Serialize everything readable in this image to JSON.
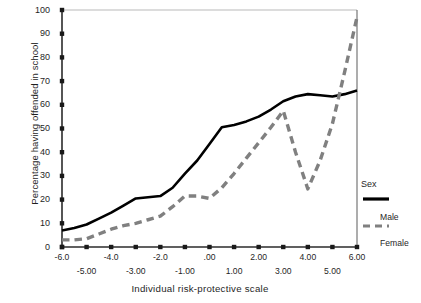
{
  "chart_data": {
    "type": "line",
    "title": "",
    "xlabel": "Individual risk-protective scale",
    "ylabel": "Percentage having offended in school",
    "xlim": [
      -6.0,
      6.0
    ],
    "ylim": [
      0,
      100
    ],
    "grid": false,
    "legend": {
      "title": "Sex",
      "position": "right",
      "entries": [
        {
          "name": "Male",
          "style": "solid",
          "color": "#000000"
        },
        {
          "name": "Female",
          "style": "dashed",
          "color": "#808080"
        }
      ]
    },
    "yticks": [
      0,
      10,
      20,
      30,
      40,
      50,
      60,
      70,
      80,
      90,
      100
    ],
    "ytick_labels": [
      "0",
      "10",
      "20",
      "30",
      "40",
      "50",
      "60",
      "70",
      "80",
      "90",
      "100"
    ],
    "xticks": [
      -6.0,
      -5.0,
      -4.0,
      -3.0,
      -2.0,
      -1.0,
      0.0,
      1.0,
      2.0,
      3.0,
      4.0,
      5.0,
      6.0
    ],
    "xtick_labels_upper": [
      "-6.0",
      "-4.0",
      "-2.0",
      ".00",
      "2.00",
      "4.00",
      "6.00"
    ],
    "xtick_values_upper": [
      -6.0,
      -4.0,
      -2.0,
      0.0,
      2.0,
      4.0,
      6.0
    ],
    "xtick_labels_lower": [
      "-5.00",
      "-3.00",
      "-1.00",
      "1.00",
      "3.00",
      "5.00"
    ],
    "xtick_values_lower": [
      -5.0,
      -3.0,
      -1.0,
      1.0,
      3.0,
      5.0
    ],
    "x": [
      -6.0,
      -5.5,
      -5.0,
      -4.5,
      -4.0,
      -3.5,
      -3.0,
      -2.5,
      -2.0,
      -1.5,
      -1.0,
      -0.5,
      0.0,
      0.5,
      1.0,
      1.5,
      2.0,
      2.5,
      3.0,
      3.5,
      4.0,
      4.5,
      5.0,
      5.5,
      6.0
    ],
    "series": [
      {
        "name": "Male",
        "color": "#000000",
        "style": "solid",
        "values": [
          7,
          8,
          9.5,
          12,
          14.5,
          17.5,
          20.5,
          21,
          21.5,
          25,
          31,
          36.5,
          43.5,
          50.5,
          51.5,
          53,
          55,
          58,
          61.5,
          63.5,
          64.5,
          64,
          63.5,
          64.5,
          66
        ]
      },
      {
        "name": "Female",
        "color": "#808080",
        "style": "dashed",
        "values": [
          3,
          3,
          3.5,
          5.5,
          7.5,
          9,
          10,
          11.5,
          13,
          17,
          21.5,
          21.5,
          20.5,
          25,
          31,
          37.5,
          44,
          50.5,
          57.5,
          40,
          24.5,
          36.5,
          52,
          74,
          97
        ]
      }
    ]
  }
}
